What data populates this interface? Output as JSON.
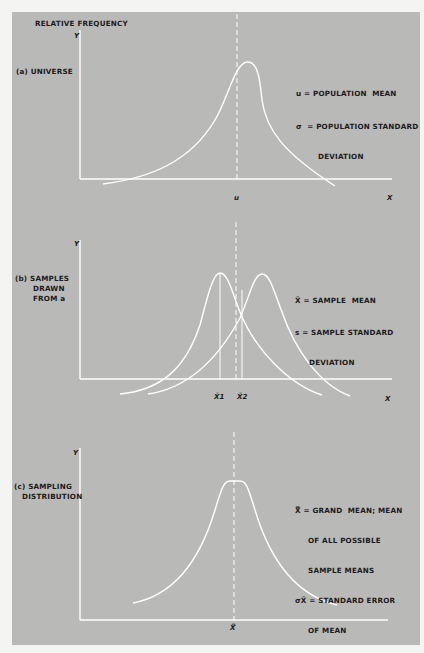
{
  "figure": {
    "y_axis_title": "RELATIVE FREQUENCY",
    "panels": [
      {
        "id": "a",
        "label": "(a) UNIVERSE",
        "y_axis": "Y",
        "x_axis": "X",
        "mean_marker": "u",
        "legend": [
          {
            "symbol": "u",
            "text": "= POPULATION  MEAN"
          },
          {
            "symbol": "σ",
            "text": "= POPULATION STANDARD",
            "continuation": "DEVIATION"
          }
        ]
      },
      {
        "id": "b",
        "label_lines": [
          "(b) SAMPLES",
          "DRAWN",
          "FROM a"
        ],
        "y_axis": "Y",
        "x_axis": "X",
        "mean_markers": [
          "X̄1",
          "X̄2"
        ],
        "legend": [
          {
            "symbol": "X̄",
            "text": "= SAMPLE  MEAN"
          },
          {
            "symbol": "s",
            "text": "= SAMPLE STANDARD",
            "continuation": "DEVIATION"
          }
        ]
      },
      {
        "id": "c",
        "label_lines": [
          "(c) SAMPLING",
          "DISTRIBUTION"
        ],
        "y_axis": "Y",
        "mean_marker": "X̿",
        "legend": [
          {
            "symbol": "X̿",
            "text": "= GRAND  MEAN; MEAN",
            "continuation_lines": [
              "OF ALL POSSIBLE",
              "SAMPLE MEANS"
            ]
          },
          {
            "symbol": "σX̄",
            "text": "= STANDARD ERROR",
            "continuation": "OF MEAN"
          }
        ]
      }
    ]
  },
  "colors": {
    "panel_bg": "#b9b9b7",
    "page_bg": "#f4f4f2",
    "curve": "#ffffff",
    "text": "#1c1c1c"
  }
}
